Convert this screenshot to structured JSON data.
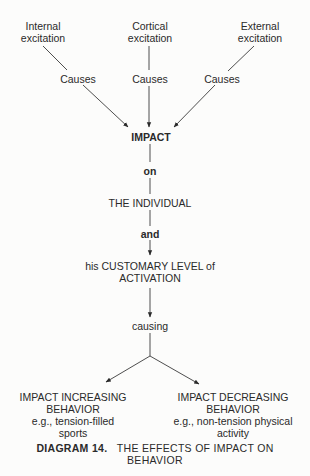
{
  "diagram": {
    "sources": [
      {
        "line1": "Internal",
        "line2": "excitation",
        "connector": "Causes"
      },
      {
        "line1": "Cortical",
        "line2": "excitation",
        "connector": "Causes"
      },
      {
        "line1": "External",
        "line2": "excitation",
        "connector": "Causes"
      }
    ],
    "impact": "IMPACT",
    "on": "on",
    "individual": "THE INDIVIDUAL",
    "and": "and",
    "customary": {
      "line1": "his CUSTOMARY LEVEL of",
      "line2": "ACTIVATION"
    },
    "causing": "causing",
    "outcomes": [
      {
        "line1": "IMPACT INCREASING",
        "line2": "BEHAVIOR",
        "line3": "e.g., tension-filled",
        "line4": "sports"
      },
      {
        "line1": "IMPACT DECREASING",
        "line2": "BEHAVIOR",
        "line3": "e.g., non-tension physical",
        "line4": "activity"
      }
    ]
  },
  "caption": {
    "label": "DIAGRAM 14.",
    "text_line1": "THE EFFECTS OF IMPACT ON",
    "text_line2": "BEHAVIOR"
  },
  "colors": {
    "background": "#fcfcfb",
    "ink": "#2a2a2a"
  }
}
